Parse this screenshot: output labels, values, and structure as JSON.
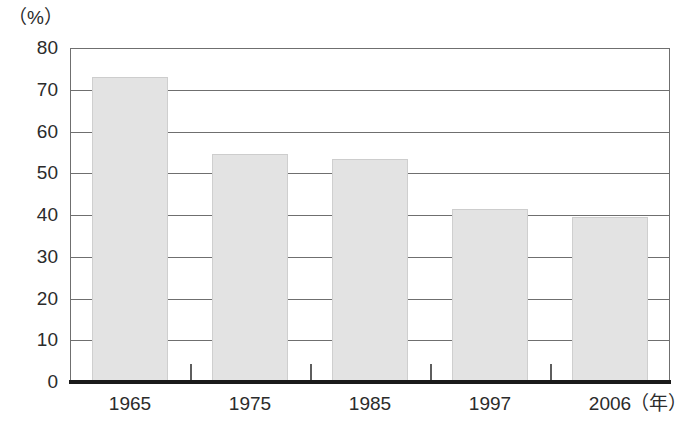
{
  "chart_data": {
    "type": "bar",
    "title": "",
    "subtitle": "",
    "categories": [
      "1965",
      "1975",
      "1985",
      "1997",
      "2006"
    ],
    "values": [
      73,
      54.5,
      53.5,
      41.5,
      39.5
    ],
    "series": [
      {
        "name": "",
        "values": [
          73,
          54.5,
          53.5,
          41.5,
          39.5
        ]
      }
    ],
    "xlabel": "（年）",
    "ylabel": "（%）",
    "y_unit_label": "（%）",
    "x_unit_label": "（年）",
    "ylim": [
      0,
      80
    ],
    "y_ticks": [
      "80",
      "70",
      "60",
      "50",
      "40",
      "30",
      "20",
      "10",
      "0"
    ],
    "y_tick_values": [
      80,
      70,
      60,
      50,
      40,
      30,
      20,
      10,
      0
    ],
    "grid": true,
    "grid_orientation": "horizontal",
    "legend": false,
    "legend_position": "none",
    "bar_fill_color": "#e3e3e3",
    "bar_border_color": "#cfcfcf",
    "axis_color": "#6f6f6f",
    "baseline_color": "#1a1a1a",
    "text_color": "#2b2b2b",
    "background_color": "#ffffff"
  }
}
